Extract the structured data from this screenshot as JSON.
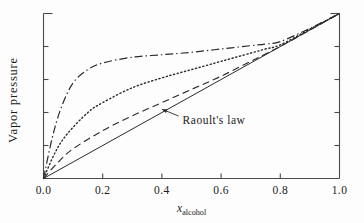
{
  "figure": {
    "background_color": "#fdfdfd",
    "ink_color": "#2a2a2a"
  },
  "chart_data": {
    "type": "line",
    "title": "",
    "xlabel_main": "x",
    "xlabel_sub": "alcohol",
    "ylabel": "Vapor pressure",
    "xlim": [
      0.0,
      1.0
    ],
    "ylim": [
      0.0,
      1.0
    ],
    "grid": false,
    "legend": "none",
    "x_ticks": [
      0.0,
      0.2,
      0.4,
      0.6,
      0.8,
      1.0
    ],
    "x_tick_labels": [
      "0.0",
      "0.2",
      "0.4",
      "0.6",
      "0.8",
      "1.0"
    ],
    "y_ticks": [
      0.0,
      0.2,
      0.4,
      0.6,
      0.8,
      1.0
    ],
    "y_tick_labels": [
      "",
      "",
      "",
      "",
      "",
      ""
    ],
    "annotations": [
      {
        "text": "Raoult's law",
        "x": 0.47,
        "y": 0.33,
        "arrow_to_x": 0.4,
        "arrow_to_y": 0.42
      }
    ],
    "series": [
      {
        "name": "Raoult's law (ideal)",
        "style": "solid",
        "x": [
          0.0,
          0.1,
          0.2,
          0.3,
          0.4,
          0.5,
          0.6,
          0.7,
          0.8,
          0.9,
          1.0
        ],
        "y": [
          0.0,
          0.1,
          0.2,
          0.3,
          0.4,
          0.5,
          0.6,
          0.7,
          0.8,
          0.9,
          1.0
        ]
      },
      {
        "name": "small positive deviation",
        "style": "dashed",
        "x": [
          0.0,
          0.05,
          0.1,
          0.2,
          0.3,
          0.4,
          0.5,
          0.6,
          0.7,
          0.75,
          0.8,
          0.9,
          1.0
        ],
        "y": [
          0.0,
          0.1,
          0.18,
          0.29,
          0.38,
          0.46,
          0.54,
          0.62,
          0.71,
          0.755,
          0.8,
          0.9,
          1.0
        ]
      },
      {
        "name": "moderate positive deviation",
        "style": "dotted",
        "x": [
          0.0,
          0.04,
          0.08,
          0.15,
          0.2,
          0.3,
          0.4,
          0.5,
          0.6,
          0.7,
          0.75,
          0.8,
          0.9,
          1.0
        ],
        "y": [
          0.0,
          0.16,
          0.27,
          0.4,
          0.46,
          0.55,
          0.61,
          0.66,
          0.71,
          0.76,
          0.785,
          0.81,
          0.905,
          1.0
        ]
      },
      {
        "name": "large positive deviation",
        "style": "dashdot",
        "x": [
          0.0,
          0.03,
          0.06,
          0.1,
          0.15,
          0.2,
          0.3,
          0.4,
          0.5,
          0.6,
          0.7,
          0.75,
          0.8,
          0.9,
          1.0
        ],
        "y": [
          0.0,
          0.25,
          0.43,
          0.58,
          0.66,
          0.7,
          0.735,
          0.75,
          0.765,
          0.785,
          0.805,
          0.815,
          0.83,
          0.91,
          1.0
        ]
      }
    ]
  }
}
